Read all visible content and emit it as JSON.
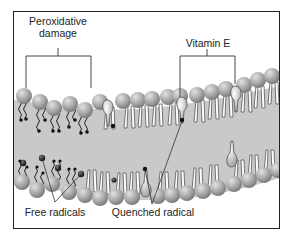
{
  "figure": {
    "type": "membrane-diagram"
  },
  "labels": {
    "peroxidative_damage_line1": "Peroxidative",
    "peroxidative_damage_line2": "damage",
    "vitamin_e": "Vitamin E",
    "free_radicals": "Free radicals",
    "quenched_radical": "Quenched radical"
  },
  "colors": {
    "membrane_interior": "#c8c8c8",
    "head_group": "#9a9a9a",
    "head_highlight": "#d8d8d8",
    "tail": "#ffffff",
    "radical": "#222222",
    "vitamin_e": "#e6e6e6",
    "line": "#333333"
  }
}
